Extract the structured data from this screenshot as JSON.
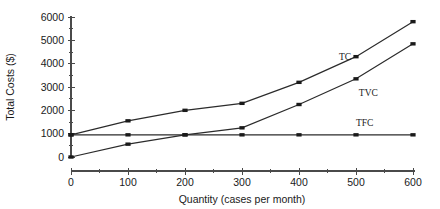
{
  "chart_data": {
    "type": "line",
    "title": "",
    "xlabel": "Quantity (cases per month)",
    "ylabel": "Total Costs ($)",
    "x": [
      0,
      100,
      200,
      300,
      400,
      500,
      600
    ],
    "xlim": [
      0,
      600
    ],
    "ylim": [
      0,
      6000
    ],
    "xticks": [
      "0",
      "100",
      "200",
      "300",
      "400",
      "500",
      "600"
    ],
    "yticks": [
      "0",
      "1000",
      "2000",
      "3000",
      "4000",
      "5000",
      "6000"
    ],
    "grid": false,
    "legend_position": "inline-right",
    "minor_ticks": true,
    "series": [
      {
        "name": "TC",
        "label": "TC",
        "color": "#2b2b2b",
        "marker": "square",
        "values": [
          950,
          1550,
          2000,
          2300,
          3200,
          4300,
          5800
        ]
      },
      {
        "name": "TVC",
        "label": "TVC",
        "color": "#2b2b2b",
        "marker": "square",
        "values": [
          0,
          550,
          950,
          1250,
          2250,
          3350,
          4850
        ]
      },
      {
        "name": "TFC",
        "label": "TFC",
        "color": "#2b2b2b",
        "marker": "square",
        "values": [
          950,
          950,
          950,
          950,
          950,
          950,
          950
        ]
      }
    ],
    "annotations": [
      {
        "text": "TC",
        "x": 470,
        "y": 4150
      },
      {
        "text": "TVC",
        "x": 505,
        "y": 2620
      },
      {
        "text": "TFC",
        "x": 500,
        "y": 1330
      }
    ]
  }
}
